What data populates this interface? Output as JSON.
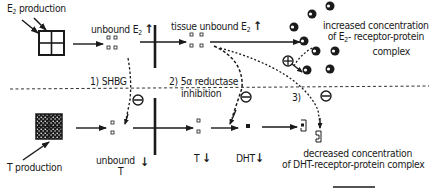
{
  "diagram": {
    "labels": {
      "e2_production": "E",
      "e2_production_sub": "2",
      "e2_production_rest": " production",
      "unbound_e2": "unbound E",
      "unbound_e2_sub": "2",
      "tissue_unbound_e2": "tissue unbound E",
      "tissue_unbound_e2_sub": "2",
      "increased_line1": "increased concentration",
      "increased_line2_a": "of E",
      "increased_line2_sub": "2",
      "increased_line2_b": "- receptor-protein",
      "increased_line3": "complex",
      "step1": "1) SHBG",
      "step2_line1": "2) 5α  reductase",
      "step2_line2": "inhibition",
      "step3": "3)",
      "t_production": "T production",
      "unbound_t_line1": "unbound",
      "unbound_t_line2": "T",
      "t_label": "T",
      "dht_label": "DHT",
      "decreased_line1": "decreased concentration",
      "decreased_line2": "of DHT-receptor-protein complex"
    },
    "symbols": {
      "up_arrow": "↑",
      "down_arrow": "↓",
      "plus_circle": "⊕",
      "minus_circle": "⊖"
    },
    "colors": {
      "ink": "#1a1a1a",
      "background": "#ffffff"
    }
  }
}
